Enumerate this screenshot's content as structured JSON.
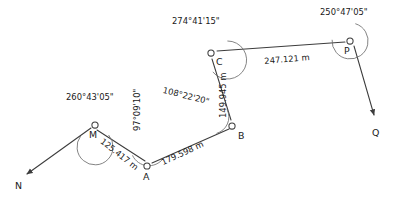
{
  "diagram": {
    "stroke_color": "#3c3c3c",
    "text_color": "#1a1a1a",
    "background_color": "#ffffff"
  },
  "stations": [
    {
      "id": "N",
      "label": "N",
      "x": 22,
      "y": 178,
      "kind": "arrow-endpoint"
    },
    {
      "id": "M",
      "label": "M",
      "x": 95,
      "y": 125,
      "kind": "vertex"
    },
    {
      "id": "A",
      "label": "A",
      "x": 147,
      "y": 166,
      "kind": "vertex"
    },
    {
      "id": "B",
      "label": "B",
      "x": 232,
      "y": 126,
      "kind": "vertex"
    },
    {
      "id": "C",
      "label": "C",
      "x": 211,
      "y": 53,
      "kind": "vertex"
    },
    {
      "id": "P",
      "label": "P",
      "x": 350,
      "y": 41,
      "kind": "vertex"
    },
    {
      "id": "Q",
      "label": "Q",
      "x": 378,
      "y": 122,
      "kind": "arrow-endpoint"
    }
  ],
  "station_labels": [
    {
      "name": "N",
      "text": "N",
      "x": 15,
      "y": 181
    },
    {
      "name": "M",
      "text": "M",
      "x": 89,
      "y": 130
    },
    {
      "name": "A",
      "text": "A",
      "x": 143,
      "y": 172
    },
    {
      "name": "B",
      "text": "B",
      "x": 238,
      "y": 131
    },
    {
      "name": "C",
      "text": "C",
      "x": 216,
      "y": 57
    },
    {
      "name": "P",
      "text": "P",
      "x": 344,
      "y": 46
    },
    {
      "name": "Q",
      "text": "Q",
      "x": 372,
      "y": 128
    }
  ],
  "distances": [
    {
      "from": "M",
      "to": "A",
      "text": "125.417 m",
      "x": 104,
      "y": 137,
      "rotate": 38
    },
    {
      "from": "A",
      "to": "B",
      "text": "179.598 m",
      "x": 160,
      "y": 159,
      "rotate": -25
    },
    {
      "from": "B",
      "to": "C",
      "text": "149.945 m",
      "x": 219,
      "y": 118,
      "rotate": -90
    },
    {
      "from": "C",
      "to": "P",
      "text": "247.121 m",
      "x": 264,
      "y": 57,
      "rotate": -5
    }
  ],
  "angles": [
    {
      "at": "M",
      "text": "260°43'05\"",
      "x": 66,
      "y": 93,
      "rotate": 0
    },
    {
      "at": "A",
      "text": "97°09'10\"",
      "x": 133,
      "y": 131,
      "rotate": -90
    },
    {
      "at": "B",
      "text": "108°22'20\"",
      "x": 164,
      "y": 86,
      "rotate": 14
    },
    {
      "at": "C",
      "text": "274°41'15\"",
      "x": 172,
      "y": 17,
      "rotate": 0
    },
    {
      "at": "P",
      "text": "250°47'05\"",
      "x": 320,
      "y": 8,
      "rotate": 0
    }
  ]
}
